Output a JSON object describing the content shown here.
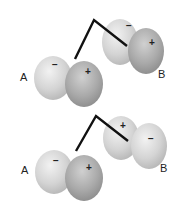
{
  "figure": {
    "panels": [
      {
        "name": "in-phase",
        "label_left": "A",
        "label_right": "B",
        "orbital_A": {
          "left_lobe_sign": "−",
          "right_lobe_sign": "+"
        },
        "orbital_B": {
          "back_lobe_sign": "−",
          "front_lobe_sign": "+"
        }
      },
      {
        "name": "out-of-phase",
        "label_left": "A",
        "label_right": "B",
        "orbital_A": {
          "left_lobe_sign": "−",
          "right_lobe_sign": "+"
        },
        "orbital_B": {
          "back_lobe_sign": "+",
          "front_lobe_sign": "−"
        }
      }
    ],
    "colors": {
      "lobe_light": "#d6d6d6",
      "lobe_dark": "#a8a8a8",
      "bond_line": "#111111",
      "text": "#222222"
    }
  }
}
